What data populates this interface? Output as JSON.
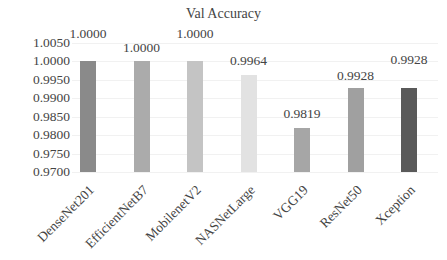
{
  "chart_data": {
    "type": "bar",
    "title": "Val Accuracy",
    "xlabel": "",
    "ylabel": "",
    "categories": [
      "DenseNet201",
      "EfficientNetB7",
      "MobilenetV2",
      "NASNetLarge",
      "VGG19",
      "ResNet50",
      "Xception"
    ],
    "values": [
      1.0,
      1.0,
      1.0,
      0.9964,
      0.9819,
      0.9928,
      0.9928
    ],
    "value_labels": [
      "1.0000",
      "1.0000",
      "1.0000",
      "0.9964",
      "0.9819",
      "0.9928",
      "0.9928"
    ],
    "colors": [
      "#8a8a8a",
      "#ababab",
      "#c4c4c4",
      "#e2e2e2",
      "#a6a6a6",
      "#a0a0a0",
      "#5a5a5a"
    ],
    "ylim": [
      0.97,
      1.005
    ],
    "yticks": [
      "0.9700",
      "0.9750",
      "0.9800",
      "0.9850",
      "0.9900",
      "0.9950",
      "1.0000",
      "1.0050"
    ],
    "grid": true,
    "legend": "none"
  }
}
